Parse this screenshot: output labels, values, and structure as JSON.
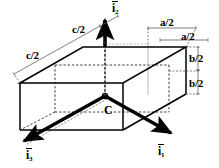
{
  "figure": {
    "type": "3d-box-coordinate-diagram",
    "background_color": "#ffffff",
    "line_color": "#000000",
    "dim_line_color": "#555555",
    "center_label": "C",
    "dimension_labels": {
      "c_upper": "c/2",
      "c_lower": "c/2",
      "a_upper": "a/2",
      "a_lower": "a/2",
      "b_upper": "b/2",
      "b_lower": "b/2"
    },
    "vectors": [
      {
        "id": "i1",
        "base": "i",
        "subscript": "1",
        "direction": "lower-right"
      },
      {
        "id": "i2",
        "base": "i",
        "subscript": "2",
        "direction": "up"
      },
      {
        "id": "i3",
        "base": "i",
        "subscript": "3",
        "direction": "lower-left"
      }
    ]
  }
}
